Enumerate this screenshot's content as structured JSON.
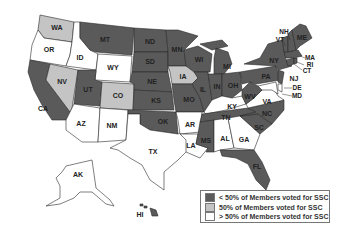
{
  "colors": {
    "less_than_50": "#5a5a5a",
    "equal_50": "#c4c4c4",
    "greater_than_50": "#ffffff",
    "border": "#2a2a2a"
  },
  "legend": {
    "items": [
      {
        "label": "< 50% of Members voted for SSC",
        "category": "less_than_50",
        "color": "#5a5a5a"
      },
      {
        "label": "50% of Members voted for SSC",
        "category": "equal_50",
        "color": "#c4c4c4"
      },
      {
        "label": "> 50% of Members voted for SSC",
        "category": "greater_than_50",
        "color": "#ffffff"
      }
    ]
  },
  "states": {
    "WA": {
      "label": "WA",
      "category": "equal_50"
    },
    "OR": {
      "label": "OR",
      "category": "greater_than_50"
    },
    "CA": {
      "label": "CA",
      "category": "less_than_50"
    },
    "ID": {
      "label": "ID",
      "category": "greater_than_50"
    },
    "NV": {
      "label": "NV",
      "category": "equal_50"
    },
    "MT": {
      "label": "MT",
      "category": "less_than_50"
    },
    "WY": {
      "label": "WY",
      "category": "greater_than_50"
    },
    "UT": {
      "label": "UT",
      "category": "less_than_50"
    },
    "CO": {
      "label": "CO",
      "category": "equal_50"
    },
    "AZ": {
      "label": "AZ",
      "category": "greater_than_50"
    },
    "NM": {
      "label": "NM",
      "category": "greater_than_50"
    },
    "ND": {
      "label": "ND",
      "category": "less_than_50"
    },
    "SD": {
      "label": "SD",
      "category": "less_than_50"
    },
    "NE": {
      "label": "NE",
      "category": "less_than_50"
    },
    "KS": {
      "label": "KS",
      "category": "less_than_50"
    },
    "OK": {
      "label": "OK",
      "category": "less_than_50"
    },
    "TX": {
      "label": "TX",
      "category": "greater_than_50"
    },
    "MN": {
      "label": "MN",
      "category": "less_than_50"
    },
    "IA": {
      "label": "IA",
      "category": "equal_50"
    },
    "MO": {
      "label": "MO",
      "category": "less_than_50"
    },
    "AR": {
      "label": "AR",
      "category": "greater_than_50"
    },
    "LA": {
      "label": "LA",
      "category": "greater_than_50"
    },
    "WI": {
      "label": "WI",
      "category": "less_than_50"
    },
    "IL": {
      "label": "IL",
      "category": "less_than_50"
    },
    "MI": {
      "label": "MI",
      "category": "less_than_50"
    },
    "IN": {
      "label": "IN",
      "category": "less_than_50"
    },
    "OH": {
      "label": "OH",
      "category": "less_than_50"
    },
    "KY": {
      "label": "KY",
      "category": "greater_than_50"
    },
    "TN": {
      "label": "TN",
      "category": "less_than_50"
    },
    "MS": {
      "label": "MS",
      "category": "less_than_50"
    },
    "AL": {
      "label": "AL",
      "category": "greater_than_50"
    },
    "GA": {
      "label": "GA",
      "category": "greater_than_50"
    },
    "FL": {
      "label": "FL",
      "category": "less_than_50"
    },
    "SC": {
      "label": "SC",
      "category": "less_than_50"
    },
    "NC": {
      "label": "NC",
      "category": "less_than_50"
    },
    "VA": {
      "label": "VA",
      "category": "greater_than_50"
    },
    "WV": {
      "label": "WV",
      "category": "less_than_50"
    },
    "PA": {
      "label": "PA",
      "category": "less_than_50"
    },
    "NY": {
      "label": "NY",
      "category": "less_than_50"
    },
    "NJ": {
      "label": "NJ",
      "category": "less_than_50"
    },
    "DE": {
      "label": "DE",
      "category": "greater_than_50"
    },
    "MD": {
      "label": "MD",
      "category": "greater_than_50"
    },
    "CT": {
      "label": "CT",
      "category": "less_than_50"
    },
    "RI": {
      "label": "RI",
      "category": "less_than_50"
    },
    "MA": {
      "label": "MA",
      "category": "less_than_50"
    },
    "VT": {
      "label": "VT",
      "category": "less_than_50"
    },
    "NH": {
      "label": "NH",
      "category": "less_than_50"
    },
    "ME": {
      "label": "ME",
      "category": "less_than_50"
    },
    "AK": {
      "label": "AK",
      "category": "greater_than_50"
    },
    "HI": {
      "label": "HI",
      "category": "less_than_50"
    }
  }
}
